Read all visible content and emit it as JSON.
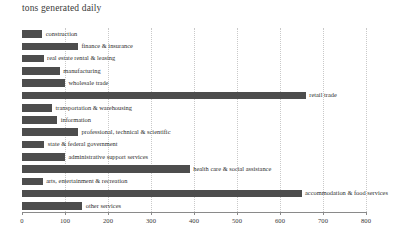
{
  "chart_data": {
    "type": "bar",
    "orientation": "horizontal",
    "title": "tons generated daily",
    "xlabel": "",
    "ylabel": "",
    "xlim": [
      0,
      800
    ],
    "grid": true,
    "legend": false,
    "bar_color": "#4d4d4d",
    "label_placement": "right-of-bar-end",
    "xticks": [
      0,
      100,
      200,
      300,
      400,
      500,
      600,
      700,
      800
    ],
    "xtick_labels": [
      "0",
      "100",
      "200",
      "300",
      "400",
      "500",
      "600",
      "700",
      "800"
    ],
    "categories": [
      "construction",
      "finance & insurance",
      "real estate rental & leasing",
      "manufacturing",
      "wholesale trade",
      "retail trade",
      "transportation & warehousing",
      "information",
      "professional, technical & scientific",
      "state & federal government",
      "administrative support services",
      "health care & social assistance",
      "arts, entertainment & recreation",
      "accommodation & food services",
      "other services"
    ],
    "values": [
      47,
      130,
      50,
      88,
      100,
      660,
      70,
      82,
      130,
      52,
      100,
      390,
      48,
      650,
      140
    ]
  }
}
